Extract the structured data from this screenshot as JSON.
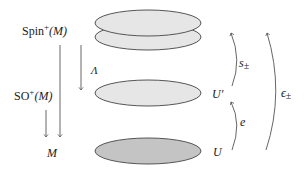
{
  "diagram": {
    "type": "fibration-bundle-diagram",
    "colors": {
      "ellipse_light": "#e6e6e6",
      "ellipse_dark": "#c4c4c4",
      "stroke": "#555555",
      "text": "#222222"
    },
    "left_labels": {
      "spin": {
        "base": "Spin",
        "sup": "+",
        "arg": "(M)"
      },
      "so": {
        "base": "SO",
        "sup": "+",
        "arg": "(M)"
      },
      "m": "M",
      "lambda": "Λ"
    },
    "right_labels": {
      "u_prime": "U′",
      "u": "U",
      "s_pm": {
        "base": "s",
        "sub": "±"
      },
      "e": "e",
      "eps_pm": {
        "base": "ϵ",
        "sub": "±"
      }
    },
    "layers": [
      {
        "name": "spin-sheet-upper",
        "shade": "light"
      },
      {
        "name": "spin-sheet-lower",
        "shade": "light"
      },
      {
        "name": "so-frame-bundle",
        "shade": "light",
        "label": "U′"
      },
      {
        "name": "base-open-set",
        "shade": "dark",
        "label": "U"
      }
    ],
    "arrows": [
      {
        "from": "Spin+(M)",
        "to": "M",
        "direction": "down"
      },
      {
        "from": "Spin+(M)",
        "to": "SO+(M)",
        "label": "Λ",
        "direction": "down"
      },
      {
        "from": "SO+(M)",
        "to": "M",
        "direction": "down"
      },
      {
        "from": "U",
        "to": "U′",
        "label": "e",
        "direction": "up"
      },
      {
        "from": "U′",
        "to": "Spin",
        "label": "s±",
        "direction": "up"
      },
      {
        "from": "U",
        "to": "Spin",
        "label": "ϵ±",
        "direction": "up"
      }
    ]
  }
}
